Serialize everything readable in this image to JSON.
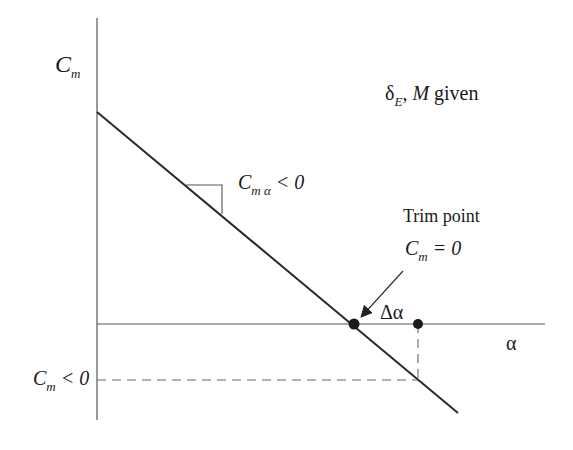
{
  "diagram": {
    "type": "pitching-moment-vs-angle-of-attack",
    "labels": {
      "y_axis": {
        "main": "C",
        "sub": "m"
      },
      "x_axis": "α",
      "given": {
        "delta": "δ",
        "delta_sub": "E",
        "rest": ", ",
        "M": "M",
        "given": " given"
      },
      "slope": {
        "main": "C",
        "sub": "m α",
        "rest": " < 0"
      },
      "trim_title": "Trim point",
      "trim_eq": {
        "main": "C",
        "sub": "m",
        "rest": " = 0"
      },
      "delta_alpha": "Δα",
      "cm_neg": {
        "main": "C",
        "sub": "m",
        "rest": " < 0"
      }
    },
    "colors": {
      "line": "#2a2a2a",
      "axis": "#555555",
      "dash": "#666666"
    },
    "geometry": {
      "origin_x": 97,
      "alpha_axis_y": 324,
      "cm_line": {
        "x1": 97,
        "y1": 112,
        "x2": 458,
        "y2": 413
      },
      "trim_point": {
        "x": 354,
        "y": 324
      },
      "perturbed_point": {
        "x": 418,
        "y": 324
      },
      "cm_neg_level_y": 380
    }
  }
}
